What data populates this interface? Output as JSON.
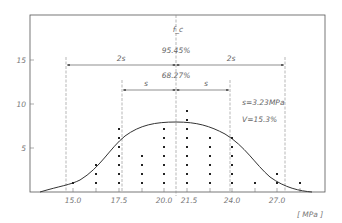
{
  "chart_data": {
    "type": "scatter",
    "title": "",
    "xlabel": "[ MPa ]",
    "ylabel": "f_c",
    "x_ticks": [
      "15.0",
      "17.5",
      "20.0",
      "21.5",
      "24.0",
      "27.0"
    ],
    "y_ticks": [
      "5",
      "10",
      "15"
    ],
    "ylim": [
      0,
      20
    ],
    "xlim": [
      12.6,
      30.5
    ],
    "grid": false,
    "legend": null,
    "series": [
      {
        "name": "frequency dot columns",
        "x": [
          15.0,
          16.25,
          17.5,
          18.75,
          20.0,
          21.5,
          22.75,
          24.0,
          25.5,
          27.0,
          28.25
        ],
        "values": [
          1,
          3,
          7,
          4,
          7,
          9,
          6,
          6,
          1,
          2,
          1
        ]
      },
      {
        "name": "normal distribution curve",
        "type": "line",
        "mean": 21.0,
        "peak": 8,
        "std": 3.23
      }
    ],
    "annotations": {
      "pct_2s": "95.45%",
      "pct_1s": "68.27%",
      "two_s_label": "2s",
      "s_label": "s",
      "std_text": "s=3.23MPa",
      "cv_text": "V=15.3%"
    }
  }
}
